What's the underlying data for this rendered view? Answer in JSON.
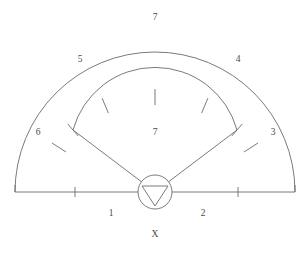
{
  "diagram": {
    "stroke_color": "#6b6b6b",
    "label_color": "#4a4a4a",
    "background_color": "#ffffff",
    "labels": {
      "zone_top_outfield": "7",
      "zone_left_outfield": "5",
      "zone_right_outfield": "4",
      "zone_far_left": "6",
      "zone_far_right": "3",
      "zone_infield_center": "7",
      "zone_bottom_left": "1",
      "zone_bottom_right": "2",
      "marker_home": "X"
    },
    "geometry": {
      "baseline_y": 192,
      "baseline_left_x": 15,
      "baseline_right_x": 295,
      "outer_arc_radius": 140,
      "outer_arc_apex_y": 46,
      "inner_arc_radius": 85,
      "inner_arc_apex_y": 96,
      "center_x": 155,
      "home_circle_radius": 17,
      "inner_arc_tick_count": 5,
      "baseline_tick_count": 2,
      "foul_tick_count": 2
    }
  }
}
